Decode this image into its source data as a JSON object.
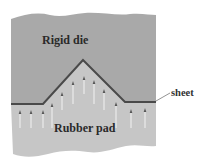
{
  "figure": {
    "labels": {
      "rigid_die": "Rigid die",
      "rubber_pad": "Rubber pad",
      "sheet": "sheet"
    },
    "colors": {
      "rigid_die": "#a9a9a9",
      "rubber_pad": "#c6c6c6",
      "sheet": "#4a4a4a",
      "arrow_shaft": "#f2f2f2",
      "arrow_head": "#555555",
      "text": "#2a2a2a"
    },
    "pressure_arrows": [
      {
        "x": 20,
        "y_top": 110,
        "y_bottom": 128
      },
      {
        "x": 31,
        "y_top": 110,
        "y_bottom": 128
      },
      {
        "x": 43,
        "y_top": 110,
        "y_bottom": 128
      },
      {
        "x": 52,
        "y_top": 103,
        "y_bottom": 128
      },
      {
        "x": 62,
        "y_top": 92,
        "y_bottom": 110
      },
      {
        "x": 73,
        "y_top": 81,
        "y_bottom": 104
      },
      {
        "x": 84,
        "y_top": 76,
        "y_bottom": 94
      },
      {
        "x": 94,
        "y_top": 80,
        "y_bottom": 104
      },
      {
        "x": 104,
        "y_top": 89,
        "y_bottom": 110
      },
      {
        "x": 116,
        "y_top": 102,
        "y_bottom": 128
      },
      {
        "x": 131,
        "y_top": 109,
        "y_bottom": 128
      },
      {
        "x": 145,
        "y_top": 108,
        "y_bottom": 128
      }
    ]
  }
}
